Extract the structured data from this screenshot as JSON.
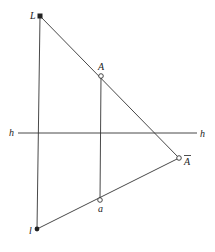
{
  "diagram": {
    "type": "descriptive-geometry-construction",
    "points": {
      "L": {
        "label": "L",
        "x": 40,
        "y": 16,
        "marker": "filled-square"
      },
      "A": {
        "label": "A",
        "x": 101,
        "y": 76,
        "marker": "open-circle"
      },
      "A_bar": {
        "label": "A",
        "overline": true,
        "x": 179,
        "y": 158,
        "marker": "open-circle"
      },
      "a": {
        "label": "a",
        "x": 100,
        "y": 200,
        "marker": "open-circle"
      },
      "l": {
        "label": "l",
        "x": 37,
        "y": 229,
        "marker": "filled-dot"
      }
    },
    "axis_h": {
      "label_left": "h",
      "label_right": "h",
      "y": 133,
      "x1": 18,
      "x2": 197
    },
    "lines": [
      {
        "from": "L",
        "to": "l",
        "name": "vertical-L-l"
      },
      {
        "from": "A",
        "to": "a",
        "name": "vertical-A-a"
      },
      {
        "from": "L",
        "to": "A_bar",
        "name": "line-L-Abar"
      },
      {
        "from": "l",
        "to": "A_bar",
        "name": "line-l-Abar"
      }
    ],
    "colors": {
      "stroke": "#333333",
      "background": "#ffffff"
    }
  }
}
